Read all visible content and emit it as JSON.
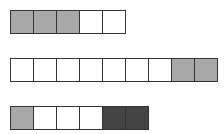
{
  "colors": {
    "empty": "#ffffff",
    "light": "#a8a8a8",
    "dark": "#444444",
    "border": "#333333"
  },
  "rows": [
    {
      "top": 10,
      "cells": [
        "light",
        "light",
        "light",
        "empty",
        "empty"
      ]
    },
    {
      "top": 58,
      "cells": [
        "empty",
        "empty",
        "empty",
        "empty",
        "empty",
        "empty",
        "empty",
        "light",
        "light"
      ]
    },
    {
      "top": 106,
      "cells": [
        "light",
        "empty",
        "empty",
        "empty",
        "dark",
        "dark"
      ]
    }
  ]
}
